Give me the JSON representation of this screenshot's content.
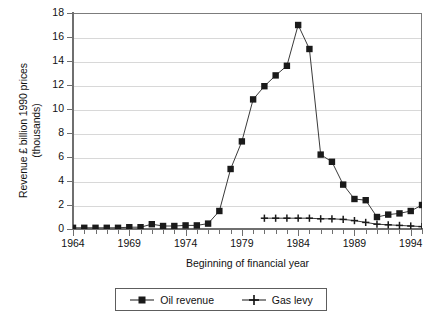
{
  "chart_data": {
    "type": "line",
    "title": "",
    "xlabel": "Beginning of financial year",
    "ylabel": "Revenue £ billion 1990 prices\n(thousands)",
    "xlim": [
      1964,
      1995
    ],
    "ylim": [
      0,
      18
    ],
    "ytick_step": 2,
    "xtick_step": 1,
    "xtick_label_step": 5,
    "grid": "horizontal",
    "legend_position": "bottom-outside",
    "yticks": [
      "0",
      "2",
      "4",
      "6",
      "8",
      "10",
      "12",
      "14",
      "16",
      "18"
    ],
    "xticks": [
      "1964",
      "1969",
      "1974",
      "1979",
      "1984",
      "1989",
      "1994"
    ],
    "x": [
      1964,
      1965,
      1966,
      1967,
      1968,
      1969,
      1970,
      1971,
      1972,
      1973,
      1974,
      1975,
      1976,
      1977,
      1978,
      1979,
      1980,
      1981,
      1982,
      1983,
      1984,
      1985,
      1986,
      1987,
      1988,
      1989,
      1990,
      1991,
      1992,
      1993,
      1994,
      1995
    ],
    "series": [
      {
        "name": "Oil revenue",
        "marker": "square",
        "color": "#1a1a1a",
        "values": [
          0.1,
          0.1,
          0.1,
          0.1,
          0.1,
          0.15,
          0.15,
          0.4,
          0.25,
          0.25,
          0.3,
          0.3,
          0.45,
          1.5,
          5.0,
          7.3,
          10.8,
          11.9,
          12.8,
          13.6,
          17.0,
          15.0,
          6.2,
          5.6,
          3.7,
          2.5,
          2.4,
          1.0,
          1.2,
          1.3,
          1.5,
          2.0
        ]
      },
      {
        "name": "Gas levy",
        "marker": "plus",
        "color": "#1a1a1a",
        "x_start": 1981,
        "values": [
          null,
          null,
          null,
          null,
          null,
          null,
          null,
          null,
          null,
          null,
          null,
          null,
          null,
          null,
          null,
          null,
          null,
          0.9,
          0.9,
          0.9,
          0.9,
          0.9,
          0.85,
          0.85,
          0.8,
          0.7,
          0.55,
          0.4,
          0.35,
          0.3,
          0.25,
          0.2
        ]
      }
    ]
  },
  "legend": {
    "items": [
      {
        "label": "Oil revenue",
        "marker": "square"
      },
      {
        "label": "Gas levy",
        "marker": "plus"
      }
    ]
  },
  "colors": {
    "axis": "#6f6f6f",
    "grid": "#d8d8d8",
    "line": "#3a3a3a",
    "marker": "#1a1a1a",
    "background": "#ffffff"
  }
}
